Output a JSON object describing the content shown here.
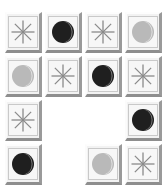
{
  "board": {
    "title": "moon-and-star tile grid",
    "rows": 4,
    "columns": 4,
    "background_color": "#ffffff",
    "tile_face_color": "#f2f2f2",
    "tile_inner_color": "#f7f7f7",
    "tile_highlight_color": "#fdfdfd",
    "tile_shadow_color": "#8e8e8e",
    "icons": {
      "asterisk": {
        "name": "asterisk-icon",
        "glyph": "✳",
        "stroke_color": "#8a8a8a"
      },
      "dark_moon": {
        "name": "dark-moon-icon",
        "glyph": "◐",
        "disc_color": "#1f1f1f",
        "crescent_color": "#7d7d7d"
      },
      "light_moon": {
        "name": "light-moon-icon",
        "glyph": "◐",
        "disc_color": "#b9b9b9",
        "crescent_color": "#e2e2e2"
      }
    },
    "cells": [
      [
        {
          "icon": "asterisk",
          "label": "asterisk"
        },
        {
          "icon": "dark_moon",
          "label": "dark moon"
        },
        {
          "icon": "asterisk",
          "label": "asterisk"
        },
        {
          "icon": "light_moon",
          "label": "light moon"
        }
      ],
      [
        {
          "icon": "light_moon",
          "label": "light moon"
        },
        {
          "icon": "asterisk",
          "label": "asterisk"
        },
        {
          "icon": "dark_moon",
          "label": "dark moon"
        },
        {
          "icon": "asterisk",
          "label": "asterisk"
        }
      ],
      [
        {
          "icon": "asterisk",
          "label": "asterisk"
        },
        {
          "icon": "empty",
          "label": ""
        },
        {
          "icon": "empty",
          "label": ""
        },
        {
          "icon": "dark_moon",
          "label": "dark moon"
        }
      ],
      [
        {
          "icon": "dark_moon",
          "label": "dark moon"
        },
        {
          "icon": "empty",
          "label": ""
        },
        {
          "icon": "light_moon",
          "label": "light moon"
        },
        {
          "icon": "asterisk",
          "label": "asterisk"
        }
      ]
    ]
  }
}
